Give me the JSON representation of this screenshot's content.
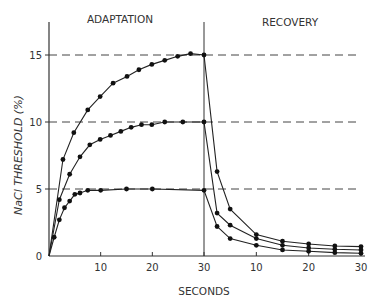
{
  "chart_data": {
    "type": "line",
    "title": "",
    "xlabel": "SECONDS",
    "ylabel": "NaCl THRESHOLD (%)",
    "ylim": [
      0,
      17
    ],
    "yticks": [
      0,
      5,
      10,
      15
    ],
    "grid": false,
    "reference_lines": [
      5,
      10,
      15
    ],
    "panels": [
      {
        "name": "ADAPTATION",
        "xlim": [
          0,
          30
        ],
        "xticks": [
          10,
          20,
          30
        ]
      },
      {
        "name": "RECOVERY",
        "xlim": [
          0,
          30
        ],
        "xticks": [
          10,
          20,
          30
        ]
      }
    ],
    "series": [
      {
        "name": "15% NaCl",
        "adaptation": {
          "x": [
            0,
            2.7,
            4.8,
            7.5,
            9.9,
            12.4,
            15.1,
            17.4,
            19.9,
            22.4,
            24.9,
            27.4,
            30
          ],
          "y": [
            0,
            7.2,
            9.2,
            10.9,
            11.9,
            12.9,
            13.4,
            13.9,
            14.3,
            14.6,
            14.9,
            15.1,
            15.0
          ]
        },
        "recovery": {
          "x": [
            0,
            2.5,
            5,
            10,
            15,
            20,
            25,
            30
          ],
          "y": [
            15.0,
            6.3,
            3.5,
            1.6,
            1.1,
            0.9,
            0.75,
            0.7
          ]
        }
      },
      {
        "name": "10% NaCl",
        "adaptation": {
          "x": [
            0,
            2.0,
            4.0,
            6.0,
            7.9,
            9.9,
            11.9,
            13.9,
            15.9,
            17.9,
            19.9,
            22.4,
            25.9,
            30
          ],
          "y": [
            0,
            4.2,
            6.1,
            7.4,
            8.3,
            8.7,
            9.0,
            9.3,
            9.6,
            9.8,
            9.8,
            10.0,
            10.0,
            10.0
          ]
        },
        "recovery": {
          "x": [
            0,
            2.5,
            5,
            10,
            15,
            20,
            25,
            30
          ],
          "y": [
            10.0,
            3.2,
            2.3,
            1.3,
            0.8,
            0.6,
            0.5,
            0.45
          ]
        }
      },
      {
        "name": "5% NaCl",
        "adaptation": {
          "x": [
            0,
            1.0,
            2.0,
            3.0,
            4.0,
            5.0,
            6.0,
            7.5,
            10,
            15,
            20,
            30
          ],
          "y": [
            0,
            1.4,
            2.7,
            3.6,
            4.1,
            4.6,
            4.7,
            4.9,
            4.9,
            5.0,
            5.0,
            4.9
          ]
        },
        "recovery": {
          "x": [
            0,
            2.5,
            5,
            10,
            15,
            20,
            25,
            30
          ],
          "y": [
            4.9,
            2.2,
            1.3,
            0.8,
            0.45,
            0.35,
            0.25,
            0.2
          ]
        }
      }
    ]
  },
  "labels": {
    "adaptation": "ADAPTATION",
    "recovery": "RECOVERY",
    "xlabel": "SECONDS",
    "ylabel": "NaCl THRESHOLD (%)",
    "yticks": [
      "0",
      "5",
      "10",
      "15"
    ],
    "xticks_adapt": [
      "10",
      "20",
      "30"
    ],
    "xticks_recov": [
      "10",
      "20",
      "30"
    ]
  }
}
